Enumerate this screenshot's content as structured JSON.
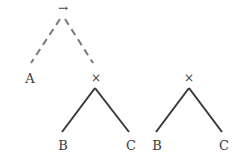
{
  "diagram": {
    "colors": {
      "line": "#3a3a3a",
      "dashed": "#777777",
      "text": "#3a3a3a"
    },
    "tree1": {
      "root": {
        "label": "→"
      },
      "left_leaf": {
        "label": "A"
      },
      "right_node": {
        "label": "×"
      },
      "sub_left": {
        "label": "B"
      },
      "sub_right": {
        "label": "C"
      }
    },
    "tree2": {
      "root": {
        "label": "×"
      },
      "left_leaf": {
        "label": "B"
      },
      "right_leaf": {
        "label": "C"
      }
    }
  }
}
